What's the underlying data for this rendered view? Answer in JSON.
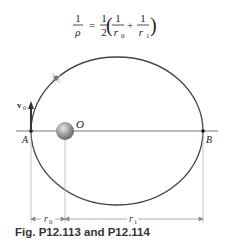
{
  "formula": {
    "lhs_num": "1",
    "lhs_den": "ρ",
    "equals": "=",
    "coef_num": "1",
    "coef_den": "2",
    "t1_num": "1",
    "t1_den": "r",
    "t1_sub": "0",
    "plus": "+",
    "t2_num": "1",
    "t2_den": "r",
    "t2_sub": "1"
  },
  "labels": {
    "point_a": "A",
    "point_b": "B",
    "center": "O",
    "velocity": "v",
    "velocity_sub": "0",
    "r0": "r",
    "r0_sub": "0",
    "r1": "r",
    "r1_sub": "1"
  },
  "caption": "Fig. P12.113 and P12.114",
  "colors": {
    "line": "#444444",
    "planet": "#999999"
  }
}
